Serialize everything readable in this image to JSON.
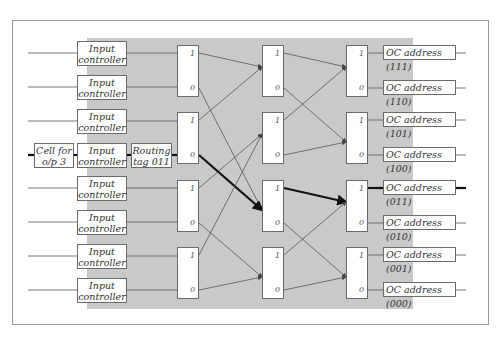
{
  "diagram": {
    "type": "banyan-switch-network",
    "input_controller_label": "Input\ncontroller",
    "input_controllers": [
      {
        "line1": "Input",
        "line2": "controller"
      },
      {
        "line1": "Input",
        "line2": "controller"
      },
      {
        "line1": "Input",
        "line2": "controller"
      },
      {
        "line1": "Input",
        "line2": "controller"
      },
      {
        "line1": "Input",
        "line2": "controller"
      },
      {
        "line1": "Input",
        "line2": "controller"
      },
      {
        "line1": "Input",
        "line2": "controller"
      },
      {
        "line1": "Input",
        "line2": "controller"
      }
    ],
    "cell": {
      "line1": "Cell for",
      "line2": "o/p 3"
    },
    "routing_tag": {
      "line1": "Routing",
      "line2": "tag 011"
    },
    "switch_port_labels": {
      "upper": "1",
      "lower": "0"
    },
    "stages": 3,
    "switches_per_stage": 4,
    "outputs": [
      "OC address (111)",
      "OC address (110)",
      "OC address (101)",
      "OC address (100)",
      "OC address (011)",
      "OC address (010)",
      "OC address (001)",
      "OC address (000)"
    ],
    "highlighted_path": {
      "input_row": 4,
      "tag": "011",
      "output": "OC address (011)"
    },
    "colors": {
      "background_region": "#c9c9c9",
      "line": "#555555",
      "highlight": "#111111",
      "box_border": "#6a6a6a"
    }
  }
}
